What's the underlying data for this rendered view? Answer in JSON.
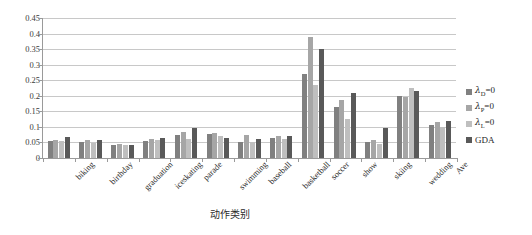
{
  "chart_data": {
    "type": "bar",
    "title": "",
    "xlabel": "动作类别",
    "ylabel": "",
    "ylim": [
      0,
      0.45
    ],
    "ytick_step": 0.05,
    "ytick_labels": [
      "0",
      "0.05",
      "0.1",
      "0.15",
      "0.2",
      "0.25",
      "0.3",
      "0.35",
      "0.4",
      "0.45"
    ],
    "grid": true,
    "legend_position": "right",
    "categories": [
      "biking",
      "birthday",
      "graduation",
      "iceskating",
      "parade",
      "swimming",
      "baseball",
      "basketball",
      "soccer",
      "show",
      "skiing",
      "wedding",
      "Ave"
    ],
    "series": [
      {
        "name": "λD=0",
        "color": "#808080",
        "values": [
          0.055,
          0.053,
          0.042,
          0.055,
          0.075,
          0.078,
          0.053,
          0.063,
          0.27,
          0.165,
          0.05,
          0.2,
          0.105
        ]
      },
      {
        "name": "λP=0",
        "color": "#a6a6a6",
        "values": [
          0.058,
          0.057,
          0.045,
          0.062,
          0.085,
          0.082,
          0.073,
          0.07,
          0.39,
          0.185,
          0.057,
          0.195,
          0.115
        ]
      },
      {
        "name": "λL=0",
        "color": "#bfbfbf",
        "values": [
          0.055,
          0.048,
          0.042,
          0.057,
          0.062,
          0.072,
          0.05,
          0.06,
          0.235,
          0.125,
          0.045,
          0.225,
          0.1
        ]
      },
      {
        "name": "GDA",
        "color": "#595959",
        "values": [
          0.068,
          0.057,
          0.042,
          0.065,
          0.098,
          0.065,
          0.06,
          0.072,
          0.35,
          0.21,
          0.098,
          0.215,
          0.12
        ]
      }
    ]
  },
  "legend": {
    "items": [
      {
        "prefix": "λ",
        "sub": "D",
        "suffix": "=0",
        "plain": ""
      },
      {
        "prefix": "λ",
        "sub": "P",
        "suffix": "=0",
        "plain": ""
      },
      {
        "prefix": "λ",
        "sub": "L",
        "suffix": "=0",
        "plain": ""
      },
      {
        "prefix": "",
        "sub": "",
        "suffix": "",
        "plain": "GDA"
      }
    ]
  },
  "axis": {
    "x_title": "动作类别"
  }
}
